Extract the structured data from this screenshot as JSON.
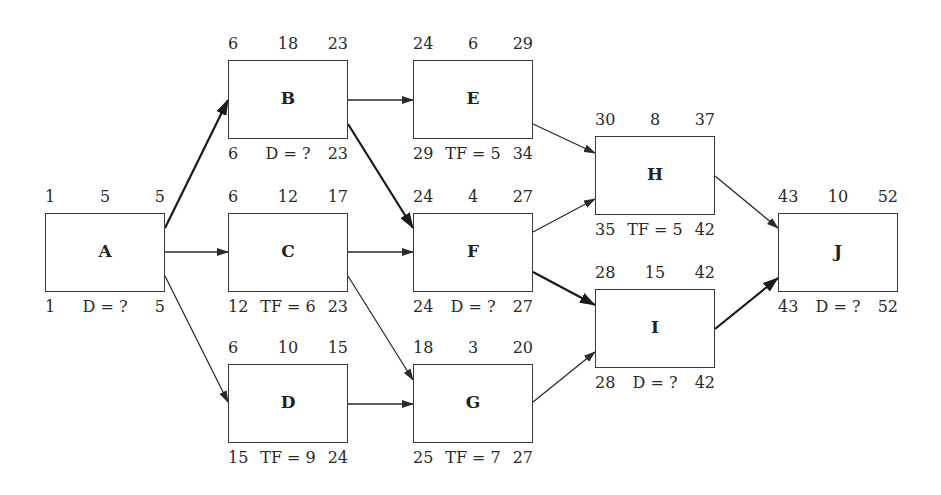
{
  "diagram": {
    "type": "activity-on-node network",
    "nodes": [
      {
        "id": "A",
        "x": 45,
        "y": 213,
        "es": "1",
        "dur": "5",
        "ef": "5",
        "ls": "1",
        "mid": "D = ?",
        "lf": "5"
      },
      {
        "id": "B",
        "x": 228,
        "y": 60,
        "es": "6",
        "dur": "18",
        "ef": "23",
        "ls": "6",
        "mid": "D = ?",
        "lf": "23"
      },
      {
        "id": "C",
        "x": 228,
        "y": 213,
        "es": "6",
        "dur": "12",
        "ef": "17",
        "ls": "12",
        "mid": "TF = 6",
        "lf": "23"
      },
      {
        "id": "D",
        "x": 228,
        "y": 364,
        "es": "6",
        "dur": "10",
        "ef": "15",
        "ls": "15",
        "mid": "TF = 9",
        "lf": "24"
      },
      {
        "id": "E",
        "x": 413,
        "y": 60,
        "es": "24",
        "dur": "6",
        "ef": "29",
        "ls": "29",
        "mid": "TF = 5",
        "lf": "34"
      },
      {
        "id": "F",
        "x": 413,
        "y": 213,
        "es": "24",
        "dur": "4",
        "ef": "27",
        "ls": "24",
        "mid": "D = ?",
        "lf": "27"
      },
      {
        "id": "G",
        "x": 413,
        "y": 364,
        "es": "18",
        "dur": "3",
        "ef": "20",
        "ls": "25",
        "mid": "TF = 7",
        "lf": "27"
      },
      {
        "id": "H",
        "x": 595,
        "y": 136,
        "es": "30",
        "dur": "8",
        "ef": "37",
        "ls": "35",
        "mid": "TF = 5",
        "lf": "42"
      },
      {
        "id": "I",
        "x": 595,
        "y": 289,
        "es": "28",
        "dur": "15",
        "ef": "42",
        "ls": "28",
        "mid": "D = ?",
        "lf": "42"
      },
      {
        "id": "J",
        "x": 778,
        "y": 213,
        "es": "43",
        "dur": "10",
        "ef": "52",
        "ls": "43",
        "mid": "D = ?",
        "lf": "52"
      }
    ],
    "edges": [
      {
        "from": "A",
        "to": "B",
        "critical": true,
        "x1": 165,
        "y1": 228,
        "x2": 228,
        "y2": 100
      },
      {
        "from": "A",
        "to": "C",
        "critical": false,
        "x1": 165,
        "y1": 252,
        "x2": 228,
        "y2": 252
      },
      {
        "from": "A",
        "to": "D",
        "critical": false,
        "x1": 165,
        "y1": 276,
        "x2": 228,
        "y2": 402
      },
      {
        "from": "B",
        "to": "E",
        "critical": false,
        "x1": 348,
        "y1": 100,
        "x2": 413,
        "y2": 100
      },
      {
        "from": "B",
        "to": "F",
        "critical": true,
        "x1": 348,
        "y1": 124,
        "x2": 413,
        "y2": 228
      },
      {
        "from": "C",
        "to": "F",
        "critical": false,
        "x1": 348,
        "y1": 252,
        "x2": 413,
        "y2": 252
      },
      {
        "from": "C",
        "to": "G",
        "critical": false,
        "x1": 348,
        "y1": 276,
        "x2": 413,
        "y2": 380
      },
      {
        "from": "D",
        "to": "G",
        "critical": false,
        "x1": 348,
        "y1": 404,
        "x2": 413,
        "y2": 404
      },
      {
        "from": "E",
        "to": "H",
        "critical": false,
        "x1": 533,
        "y1": 124,
        "x2": 595,
        "y2": 153
      },
      {
        "from": "F",
        "to": "H",
        "critical": false,
        "x1": 533,
        "y1": 232,
        "x2": 595,
        "y2": 199
      },
      {
        "from": "F",
        "to": "I",
        "critical": true,
        "x1": 533,
        "y1": 272,
        "x2": 595,
        "y2": 305
      },
      {
        "from": "G",
        "to": "I",
        "critical": false,
        "x1": 533,
        "y1": 402,
        "x2": 595,
        "y2": 352
      },
      {
        "from": "H",
        "to": "J",
        "critical": false,
        "x1": 715,
        "y1": 176,
        "x2": 778,
        "y2": 228
      },
      {
        "from": "I",
        "to": "J",
        "critical": true,
        "x1": 715,
        "y1": 329,
        "x2": 778,
        "y2": 278
      }
    ]
  }
}
